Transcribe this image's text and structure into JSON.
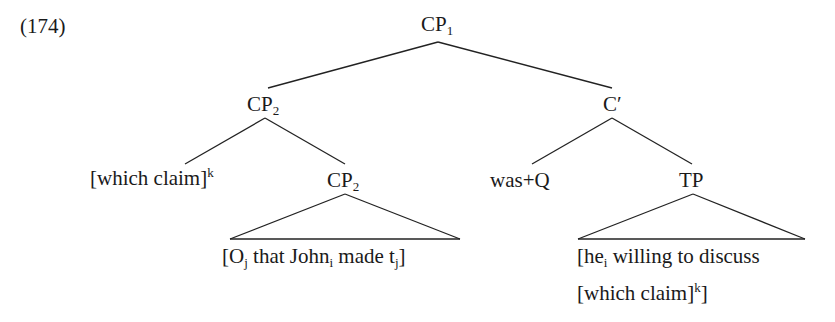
{
  "example_number": "(174)",
  "tree": {
    "root": {
      "label": "CP",
      "sub": "1"
    },
    "left_cp": {
      "label": "CP",
      "sub": "2"
    },
    "c_bar": {
      "label": "C′"
    },
    "which_claim": {
      "text": "[which claim]",
      "sup": "k"
    },
    "lower_cp": {
      "label": "CP",
      "sub": "2"
    },
    "lower_cp_content": {
      "p1": "[O",
      "s1": "j",
      "p2": " that John",
      "s2": "i",
      "p3": " made t",
      "s3": "j",
      "p4": "]"
    },
    "was_q": {
      "text": "was+Q"
    },
    "tp": {
      "label": "TP"
    },
    "tp_content": {
      "line1_a": "[he",
      "line1_sub": "i",
      "line1_b": " willing to discuss",
      "line2_a": "[which claim]",
      "line2_sup": "k",
      "line2_b": "]"
    }
  }
}
